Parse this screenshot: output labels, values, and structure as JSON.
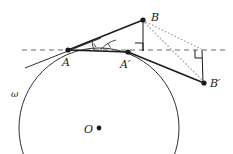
{
  "figure": {
    "type": "geometry-diagram",
    "background": "#ffffff",
    "stroke_color": "#1a1a1a",
    "dotted_color": "#a0a0a0",
    "dashed_color": "#555555"
  },
  "labels": {
    "A": "A",
    "A_prime": "A′",
    "B": "B",
    "B_prime": "B′",
    "O": "O",
    "omega": "ω"
  },
  "points": {
    "A": {
      "x": 68,
      "y": 50,
      "label": "A",
      "filled": true
    },
    "A_prime": {
      "x": 128,
      "y": 52,
      "label": "A′",
      "filled": true
    },
    "B": {
      "x": 143,
      "y": 20,
      "label": "B",
      "filled": true
    },
    "B_prime": {
      "x": 204,
      "y": 83,
      "label": "B′",
      "filled": true
    },
    "O": {
      "x": 99,
      "y": 128,
      "label": "O",
      "filled": true
    },
    "foot_B": {
      "x": 143,
      "y": 51,
      "label": "",
      "filled": false
    },
    "foot_B_prime": {
      "x": 202,
      "y": 50,
      "label": "",
      "filled": false
    }
  },
  "circle": {
    "name": "omega",
    "center_x": 99,
    "center_y": 128,
    "radius": 80,
    "label": "ω",
    "label_x": 11,
    "label_y": 90
  },
  "segments": [
    {
      "name": "dashed-horizontal-line",
      "x1": 22,
      "y1": 50,
      "x2": 228,
      "y2": 50,
      "style": "dashed"
    },
    {
      "name": "tangent-at-A",
      "x1": 25,
      "y1": 68,
      "x2": 100,
      "y2": 38,
      "style": "solid"
    },
    {
      "name": "segment-A-to-B",
      "x1": 68,
      "y1": 50,
      "x2": 143,
      "y2": 20,
      "style": "solid"
    },
    {
      "name": "segment-A-to-Aprime",
      "x1": 68,
      "y1": 50,
      "x2": 128,
      "y2": 52,
      "style": "solid"
    },
    {
      "name": "segment-Aprime-to-Bprime",
      "x1": 128,
      "y1": 52,
      "x2": 204,
      "y2": 83,
      "style": "solid"
    },
    {
      "name": "perpendicular-from-B",
      "x1": 143,
      "y1": 20,
      "x2": 143,
      "y2": 51,
      "style": "solid"
    },
    {
      "name": "perpendicular-from-Bprime",
      "x1": 202,
      "y1": 50,
      "x2": 203,
      "y2": 82,
      "style": "solid"
    },
    {
      "name": "dotted-B-to-Bprime",
      "x1": 144,
      "y1": 22,
      "x2": 203,
      "y2": 82,
      "style": "dotted"
    },
    {
      "name": "dotted-B-to-foot",
      "x1": 145,
      "y1": 21,
      "x2": 201,
      "y2": 50,
      "style": "dotted"
    }
  ],
  "angle_marks": [
    {
      "name": "angle-at-A",
      "vertex_x": 68,
      "vertex_y": 50,
      "radius": 26,
      "tick": true
    },
    {
      "name": "angle-at-Aprime",
      "vertex_x": 128,
      "vertex_y": 52,
      "radius": 28,
      "tick": true
    }
  ],
  "right_angle_marks": [
    {
      "name": "right-angle-at-foot-B",
      "x": 135,
      "y": 43,
      "size": 8
    },
    {
      "name": "right-angle-at-foot-Bprime",
      "x": 195,
      "y": 50,
      "size": 8
    }
  ]
}
